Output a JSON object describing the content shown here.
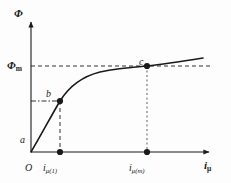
{
  "figure": {
    "background_color": "#fdfdfd",
    "line_color": "#1a1a1a",
    "dotted_color": "#8c8c8c",
    "width": 231,
    "height": 183
  },
  "axes": {
    "y_axis_label": "Φ",
    "x_axis_label": "i",
    "x_axis_label_sub": "μ",
    "origin_label": "O",
    "y_origin_px": 152,
    "x_origin_px": 31
  },
  "y_ticks": [
    {
      "id": "phi-m",
      "label": "Φ",
      "sub": "m",
      "y_px": 66,
      "guide": "dashed",
      "guide_color": "#1a1a1a"
    },
    {
      "id": "phi-b",
      "label": "",
      "sub": "",
      "y_px": 101,
      "guide": "dash-dot",
      "guide_color": "#1a1a1a"
    }
  ],
  "x_ticks": [
    {
      "id": "i-mu-1",
      "label": "i",
      "sub": "μ(1)",
      "x_px": 60,
      "guide": "dashed",
      "guide_color": "#1a1a1a",
      "marker": "filled-circle"
    },
    {
      "id": "i-mu-m",
      "label": "i",
      "sub": "μ(m)",
      "x_px": 147,
      "guide": "dotted",
      "guide_color": "#8c8c8c",
      "marker": "filled-circle"
    }
  ],
  "points": [
    {
      "id": "a",
      "label": "a",
      "x_px": 31,
      "y_px": 152,
      "marker": "none",
      "label_dx": -11,
      "label_dy": -17
    },
    {
      "id": "b",
      "label": "b",
      "x_px": 60,
      "y_px": 101,
      "marker": "filled-circle",
      "label_dx": -14,
      "label_dy": -12
    },
    {
      "id": "c",
      "label": "c",
      "x_px": 147,
      "y_px": 66,
      "marker": "filled-circle",
      "label_dx": -8,
      "label_dy": -9
    }
  ],
  "curve": {
    "name": "saturation-curve",
    "path": "M 31 152 C 40 137, 50 118, 60 101 C 70 85, 84 76, 100 72 C 118 68, 134 67, 147 66 C 165 64, 184 61, 203 58",
    "stroke_width": 1.6,
    "color": "#1a1a1a"
  },
  "guides": {
    "phim_horizontal": {
      "name": "phi-m-guide",
      "x1": 31,
      "y1": 66,
      "x2": 212,
      "y2": 66,
      "dash": "4,3",
      "color": "#1a1a1a"
    },
    "b_horizontal": {
      "name": "b-level-guide",
      "x1": 31,
      "y1": 101,
      "x2": 60,
      "y2": 101,
      "dash": "5,2,1.5,2",
      "color": "#1a1a1a"
    },
    "b_vertical": {
      "name": "i-mu-1-guide",
      "x1": 60,
      "y1": 101,
      "x2": 60,
      "y2": 152,
      "dash": "4,3",
      "color": "#1a1a1a"
    },
    "c_vertical": {
      "name": "i-mu-m-guide",
      "x1": 147,
      "y1": 66,
      "x2": 147,
      "y2": 152,
      "dash": "2,2.5",
      "color": "#8c8c8c"
    }
  }
}
